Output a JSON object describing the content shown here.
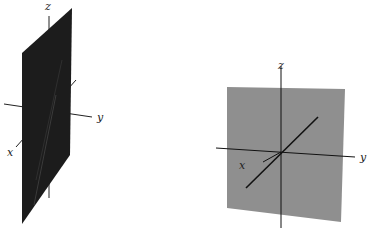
{
  "figures": [
    {
      "id": "left",
      "description": "Dark plane containing the z-axis, seen edge-on obliquely",
      "plane_color": "#1c1c1c",
      "axis_labels": {
        "x": "x",
        "y": "y",
        "z": "z"
      }
    },
    {
      "id": "right",
      "description": "Gray plane facing the viewer, with x, y, z axes and a diagonal line through the origin",
      "plane_color": "#8f8f8f",
      "axis_labels": {
        "x": "x",
        "y": "y",
        "z": "z"
      }
    }
  ]
}
